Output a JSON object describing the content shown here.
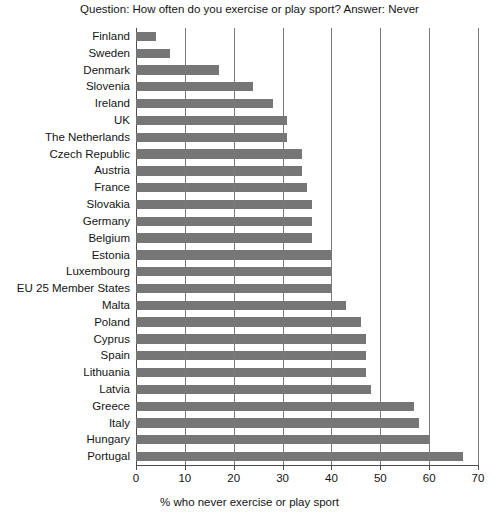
{
  "chart_data": {
    "type": "bar",
    "orientation": "horizontal",
    "title": "Question: How often do you exercise or play sport? Answer: Never",
    "xlabel": "% who never exercise or play sport",
    "ylabel": "",
    "xlim": [
      0,
      70
    ],
    "xticks": [
      0,
      10,
      20,
      30,
      40,
      50,
      60,
      70
    ],
    "xtick_labels": [
      "0",
      "10",
      "20",
      "30",
      "40",
      "50",
      "60",
      "70"
    ],
    "grid": "vertical",
    "legend": "none",
    "bar_color": "#767676",
    "categories": [
      "Finland",
      "Sweden",
      "Denmark",
      "Slovenia",
      "Ireland",
      "UK",
      "The Netherlands",
      "Czech Republic",
      "Austria",
      "France",
      "Slovakia",
      "Germany",
      "Belgium",
      "Estonia",
      "Luxembourg",
      "EU 25 Member States",
      "Malta",
      "Poland",
      "Cyprus",
      "Spain",
      "Lithuania",
      "Latvia",
      "Greece",
      "Italy",
      "Hungary",
      "Portugal"
    ],
    "values": [
      4,
      7,
      17,
      24,
      28,
      31,
      31,
      34,
      34,
      35,
      36,
      36,
      36,
      40,
      40,
      40,
      43,
      46,
      47,
      47,
      47,
      48,
      57,
      58,
      60,
      67
    ]
  }
}
